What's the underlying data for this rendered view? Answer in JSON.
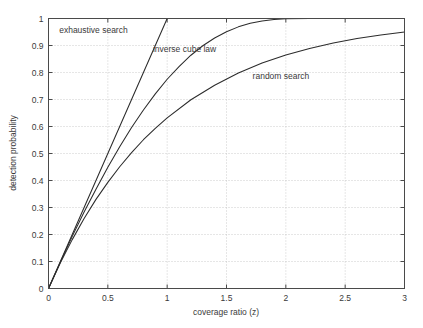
{
  "chart_data": {
    "type": "line",
    "title": "",
    "xlabel": "coverage ratio (z)",
    "ylabel": "detection probability",
    "xlim": [
      0,
      3
    ],
    "ylim": [
      0,
      1
    ],
    "grid": true,
    "legend_position": "inline-annotations",
    "xticks": [
      0,
      0.5,
      1,
      1.5,
      2,
      2.5,
      3
    ],
    "xticklabels": [
      "0",
      "0.5",
      "1",
      "1.5",
      "2",
      "2.5",
      "3"
    ],
    "yticks": [
      0,
      0.1,
      0.2,
      0.3,
      0.4,
      0.5,
      0.6,
      0.7,
      0.8,
      0.9,
      1
    ],
    "yticklabels": [
      "0",
      "0.1",
      "0.2",
      "0.3",
      "0.4",
      "0.5",
      "0.6",
      "0.7",
      "0.8",
      "0.9",
      "1"
    ],
    "series": [
      {
        "name": "exhaustive search",
        "label_x": 0.09,
        "label_y": 0.945,
        "x": [
          0,
          0.1,
          0.2,
          0.3,
          0.4,
          0.5,
          0.6,
          0.7,
          0.8,
          0.9,
          1.0
        ],
        "values": [
          0,
          0.1,
          0.2,
          0.3,
          0.4,
          0.5,
          0.6,
          0.7,
          0.8,
          0.9,
          1.0
        ]
      },
      {
        "name": "inverse cube law",
        "label_x": 0.88,
        "label_y": 0.875,
        "x": [
          0,
          0.1,
          0.2,
          0.3,
          0.4,
          0.5,
          0.6,
          0.7,
          0.8,
          0.9,
          1.0,
          1.1,
          1.2,
          1.3,
          1.4,
          1.5,
          1.6,
          1.7,
          1.8,
          1.9,
          2.0,
          2.2,
          2.4,
          2.6,
          2.8,
          3.0
        ],
        "values": [
          0,
          0.098,
          0.193,
          0.283,
          0.368,
          0.449,
          0.525,
          0.596,
          0.661,
          0.721,
          0.775,
          0.822,
          0.864,
          0.899,
          0.928,
          0.951,
          0.969,
          0.982,
          0.991,
          0.996,
          0.999,
          1.0,
          1.0,
          1.0,
          1.0,
          1.0
        ]
      },
      {
        "name": "random search",
        "label_x": 1.72,
        "label_y": 0.775,
        "x": [
          0,
          0.1,
          0.2,
          0.3,
          0.4,
          0.5,
          0.6,
          0.7,
          0.8,
          0.9,
          1.0,
          1.2,
          1.4,
          1.6,
          1.8,
          2.0,
          2.2,
          2.4,
          2.6,
          2.8,
          3.0
        ],
        "values": [
          0,
          0.095,
          0.181,
          0.259,
          0.33,
          0.393,
          0.451,
          0.503,
          0.551,
          0.593,
          0.632,
          0.699,
          0.753,
          0.798,
          0.835,
          0.865,
          0.889,
          0.909,
          0.926,
          0.939,
          0.95
        ]
      }
    ]
  },
  "colors": {
    "background": "#ffffff",
    "axis": "#4a4a4a",
    "grid": "#b9b9b9",
    "curve": "#2b2b2b",
    "text": "#3a3a3a"
  }
}
